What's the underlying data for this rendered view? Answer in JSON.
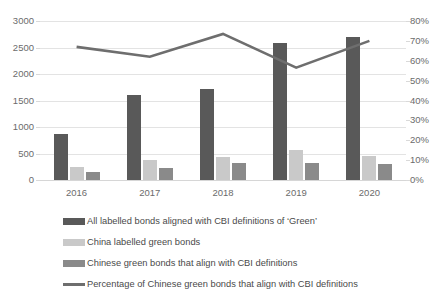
{
  "chart_data": {
    "type": "bar",
    "title": "",
    "subtitle": "",
    "xlabel": "",
    "ylabel": "",
    "categories": [
      "2016",
      "2017",
      "2018",
      "2019",
      "2020"
    ],
    "grid": true,
    "legend_position": "bottom",
    "axes": {
      "left": {
        "label": "",
        "min": 0,
        "max": 3000,
        "step": 500,
        "ticks": [
          "0",
          "500",
          "1000",
          "1500",
          "2000",
          "2500",
          "3000"
        ],
        "tick_values": [
          0,
          500,
          1000,
          1500,
          2000,
          2500,
          3000
        ]
      },
      "right": {
        "label": "",
        "min": 0,
        "max": 80,
        "step": 10,
        "ticks": [
          "0%",
          "10%",
          "20%",
          "30%",
          "40%",
          "50%",
          "60%",
          "70%",
          "80%"
        ],
        "tick_values": [
          0,
          10,
          20,
          30,
          40,
          50,
          60,
          70,
          80
        ]
      }
    },
    "series": [
      {
        "name": "All labelled bonds aligned with CBI definitions of ‘Green’",
        "type": "bar",
        "axis": "left",
        "color": "#595959",
        "values": [
          870,
          1610,
          1710,
          2590,
          2700
        ]
      },
      {
        "name": "China labelled green bonds",
        "type": "bar",
        "axis": "left",
        "color": "#c9c9c9",
        "values": [
          240,
          375,
          435,
          560,
          450
        ]
      },
      {
        "name": "Chinese green bonds that align with CBI definitions",
        "type": "bar",
        "axis": "left",
        "color": "#8a8a8a",
        "values": [
          155,
          230,
          320,
          320,
          310
        ]
      },
      {
        "name": "Percentage of Chinese green bonds that align with CBI definitions",
        "type": "line",
        "axis": "right",
        "color": "#6e6e6e",
        "values": [
          67,
          62,
          73.5,
          56.5,
          70
        ]
      }
    ]
  },
  "legend": {
    "items": [
      {
        "label": "All labelled bonds aligned with CBI definitions of ‘Green’",
        "color": "#595959",
        "shape": "bar-swatch"
      },
      {
        "label": "China labelled green bonds",
        "color": "#c9c9c9",
        "shape": "bar-swatch"
      },
      {
        "label": "Chinese green bonds that align with CBI definitions",
        "color": "#8a8a8a",
        "shape": "bar-swatch"
      },
      {
        "label": "Percentage of Chinese green bonds that align with CBI definitions",
        "color": "#6e6e6e",
        "shape": "line-swatch"
      }
    ]
  }
}
